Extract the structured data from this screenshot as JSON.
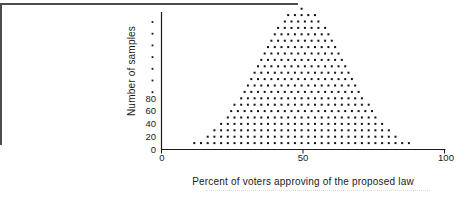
{
  "chart_data": {
    "type": "dotplot",
    "xlabel": "Percent of voters approving of the proposed law",
    "ylabel": "Number of samples",
    "x_tick_labels": [
      "0",
      "50",
      "100"
    ],
    "x_tick_values": [
      0,
      50,
      100
    ],
    "y_tick_labels": [
      "0",
      "20",
      "40",
      "60",
      "80"
    ],
    "y_tick_values": [
      0,
      20,
      40,
      60,
      80
    ],
    "y_axis_continuation_dot_count": 7,
    "xlim": [
      0,
      100
    ],
    "ylim": [
      0,
      230
    ],
    "grid": false,
    "legend": "none",
    "dot_color": "#111111",
    "axis_color": "#1a1a1a",
    "center_pct": 49.5,
    "dot_spacing_pct": 2.37,
    "rows": [
      {
        "samples": 10,
        "dots": 33
      },
      {
        "samples": 20,
        "dots": 29
      },
      {
        "samples": 30,
        "dots": 27
      },
      {
        "samples": 40,
        "dots": 25
      },
      {
        "samples": 50,
        "dots": 23
      },
      {
        "samples": 60,
        "dots": 22
      },
      {
        "samples": 70,
        "dots": 21
      },
      {
        "samples": 80,
        "dots": 19
      },
      {
        "samples": 90,
        "dots": 18
      },
      {
        "samples": 100,
        "dots": 17
      },
      {
        "samples": 110,
        "dots": 16
      },
      {
        "samples": 120,
        "dots": 15
      },
      {
        "samples": 130,
        "dots": 14
      },
      {
        "samples": 140,
        "dots": 13
      },
      {
        "samples": 150,
        "dots": 12
      },
      {
        "samples": 160,
        "dots": 11
      },
      {
        "samples": 170,
        "dots": 10
      },
      {
        "samples": 180,
        "dots": 9
      },
      {
        "samples": 190,
        "dots": 8
      },
      {
        "samples": 200,
        "dots": 6
      },
      {
        "samples": 210,
        "dots": 5
      },
      {
        "samples": 220,
        "dots": 1
      }
    ],
    "layout": {
      "x0": 161.5,
      "xscale": 2.83,
      "y0": 149.5,
      "yscale": 0.64,
      "x_axis_end": 445.5,
      "y_axis_top": 12,
      "tick_len": 4,
      "cont_dots_x": 152.5,
      "cont_dots_y_start": 22,
      "cont_dots_y_step": 11.7
    }
  }
}
